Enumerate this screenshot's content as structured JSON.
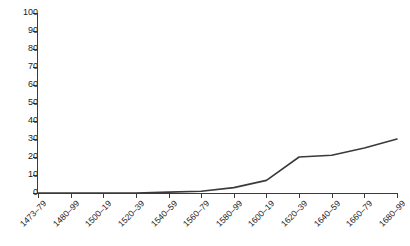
{
  "chart_data": {
    "type": "line",
    "title": "",
    "subtitle": "",
    "xlabel": "",
    "ylabel": "",
    "categories": [
      "1473–79",
      "1480–99",
      "1500–19",
      "1520–39",
      "1540–59",
      "1560–79",
      "1580–99",
      "1600–19",
      "1620–39",
      "1640–59",
      "1660–79",
      "1680–99"
    ],
    "values": [
      0,
      0,
      0,
      0,
      0.5,
      1,
      3,
      7,
      20,
      21,
      25,
      30
    ],
    "series": [
      {
        "name": "",
        "values": [
          0,
          0,
          0,
          0,
          0.5,
          1,
          3,
          7,
          20,
          21,
          25,
          30
        ]
      }
    ],
    "ylim": [
      0,
      100
    ],
    "y_ticks": [
      0,
      10,
      20,
      30,
      40,
      50,
      60,
      70,
      80,
      90,
      100
    ],
    "y_tick_labels": [
      "0",
      "10",
      "20",
      "30",
      "40",
      "50",
      "60",
      "70",
      "80",
      "90",
      "100"
    ],
    "grid": false,
    "legend": false,
    "legend_position": "none",
    "line_color": "#3a3a3a",
    "background_color": "#ffffff",
    "axis_color": "#3a3a3a",
    "markers": false,
    "x_tick_label_rotation": -45
  }
}
